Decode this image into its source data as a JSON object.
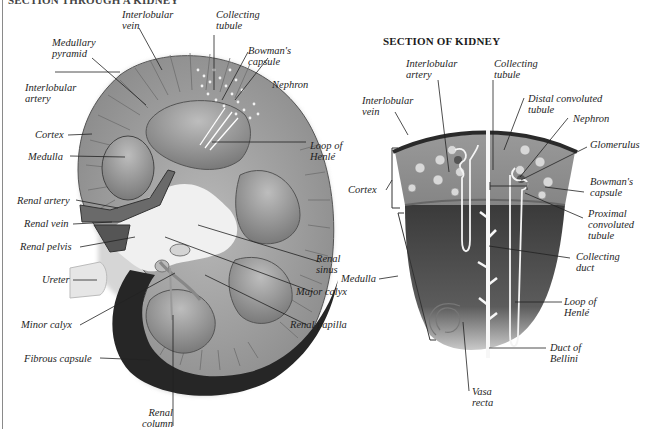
{
  "headings": {
    "left": "SECTION THROUGH A KIDNEY",
    "right": "SECTION OF KIDNEY"
  },
  "left_diagram": {
    "labels": [
      {
        "id": "interlobular-vein",
        "text": [
          "Interlobular",
          "vein"
        ]
      },
      {
        "id": "collecting-tubule",
        "text": [
          "Collecting",
          "tubule"
        ]
      },
      {
        "id": "medullary-pyramid",
        "text": [
          "Medullary",
          "pyramid"
        ]
      },
      {
        "id": "bowmans-capsule",
        "text": [
          "Bowman's",
          "capsule"
        ]
      },
      {
        "id": "nephron",
        "text": [
          "Nephron"
        ]
      },
      {
        "id": "interlobular-artery",
        "text": [
          "Interlobular",
          "artery"
        ]
      },
      {
        "id": "cortex",
        "text": [
          "Cortex"
        ]
      },
      {
        "id": "medulla",
        "text": [
          "Medulla"
        ]
      },
      {
        "id": "loop-of-henle",
        "text": [
          "Loop of",
          "Henlé"
        ]
      },
      {
        "id": "renal-artery",
        "text": [
          "Renal artery"
        ]
      },
      {
        "id": "renal-vein",
        "text": [
          "Renal vein"
        ]
      },
      {
        "id": "renal-pelvis",
        "text": [
          "Renal pelvis"
        ]
      },
      {
        "id": "renal-sinus",
        "text": [
          "Renal",
          "sinus"
        ]
      },
      {
        "id": "ureter",
        "text": [
          "Ureter"
        ]
      },
      {
        "id": "major-calyx",
        "text": [
          "Major calyx"
        ]
      },
      {
        "id": "minor-calyx",
        "text": [
          "Minor calyx"
        ]
      },
      {
        "id": "renal-papilla",
        "text": [
          "Renal papilla"
        ]
      },
      {
        "id": "fibrous-capsule",
        "text": [
          "Fibrous capsule"
        ]
      },
      {
        "id": "renal-column",
        "text": [
          "Renal",
          "column"
        ]
      }
    ]
  },
  "right_diagram": {
    "labels": [
      {
        "id": "interlobular-artery",
        "text": [
          "Interlobular",
          "artery"
        ]
      },
      {
        "id": "collecting-tubule",
        "text": [
          "Collecting",
          "tubule"
        ]
      },
      {
        "id": "interlobular-vein",
        "text": [
          "Interlobular",
          "vein"
        ]
      },
      {
        "id": "distal-convoluted-tubule",
        "text": [
          "Distal convoluted",
          "tubule"
        ]
      },
      {
        "id": "nephron",
        "text": [
          "Nephron"
        ]
      },
      {
        "id": "glomerulus",
        "text": [
          "Glomerulus"
        ]
      },
      {
        "id": "cortex",
        "text": [
          "Cortex"
        ]
      },
      {
        "id": "bowmans-capsule",
        "text": [
          "Bowman's",
          "capsule"
        ]
      },
      {
        "id": "proximal-convoluted-tubule",
        "text": [
          "Proximal",
          "convoluted",
          "tubule"
        ]
      },
      {
        "id": "collecting-duct",
        "text": [
          "Collecting",
          "duct"
        ]
      },
      {
        "id": "medulla",
        "text": [
          "Medulla"
        ]
      },
      {
        "id": "loop-of-henle",
        "text": [
          "Loop of",
          "Henlé"
        ]
      },
      {
        "id": "duct-of-bellini",
        "text": [
          "Duct of",
          "Bellini"
        ]
      },
      {
        "id": "vasa-recta",
        "text": [
          "Vasa",
          "recta"
        ]
      }
    ]
  },
  "colors": {
    "capsule": "#2b2b2b",
    "cortex": "#9a9a9a",
    "medulla": "#7d7d7d",
    "sinus": "#eeeeee",
    "wedge_cortex": "#8f8f8f",
    "wedge_medulla": "#4a4a4a"
  }
}
